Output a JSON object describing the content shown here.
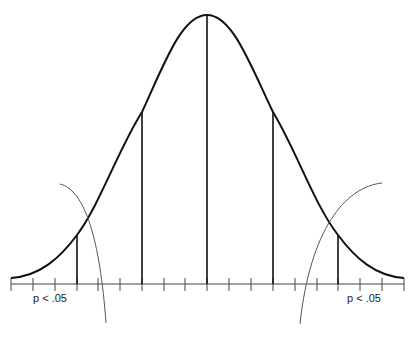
{
  "diagram": {
    "type": "normal-distribution-with-rejection-regions",
    "labels": {
      "left_tail": "p < .05",
      "right_tail": "p < .05"
    },
    "axis": {
      "tick_count": 18,
      "standard_deviation_markers": [
        "-2",
        "-1",
        "0",
        "+1",
        "+2"
      ]
    },
    "colors": {
      "curve": "#111111",
      "axis": "#333333",
      "thin_curves": "#555555",
      "background": "#ffffff"
    }
  }
}
